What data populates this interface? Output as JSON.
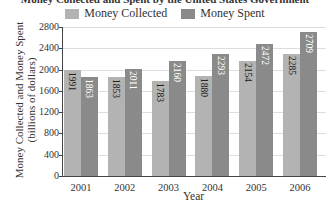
{
  "chart_data": {
    "type": "bar",
    "title": "Money Collected and Spent by the United States Government",
    "categories": [
      "2001",
      "2002",
      "2003",
      "2004",
      "2005",
      "2006"
    ],
    "series": [
      {
        "name": "Money Collected",
        "color": "#b3b3b3",
        "values": [
          1991,
          1853,
          1783,
          1880,
          2154,
          2285
        ]
      },
      {
        "name": "Money Spent",
        "color": "#8a8a8a",
        "values": [
          1863,
          2011,
          2160,
          2293,
          2472,
          2709
        ]
      }
    ],
    "xlabel": "Year",
    "ylabel": "Money Collected and Money Spent (billions of dollars)",
    "ylim": [
      0,
      2800
    ],
    "yticks": [
      0,
      400,
      800,
      1200,
      1600,
      2000,
      2400,
      2800
    ],
    "grid": true,
    "legend_position": "top"
  }
}
